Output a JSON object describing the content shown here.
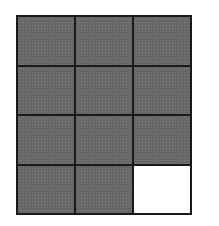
{
  "figure": {
    "rows": 4,
    "columns": 3,
    "shaded_color": "#8a8a8a",
    "empty_color": "#ffffff",
    "line_color": "#1a1a1a",
    "cells": [
      {
        "row": 1,
        "col": 1,
        "state": "shaded"
      },
      {
        "row": 1,
        "col": 2,
        "state": "shaded"
      },
      {
        "row": 1,
        "col": 3,
        "state": "shaded"
      },
      {
        "row": 2,
        "col": 1,
        "state": "shaded"
      },
      {
        "row": 2,
        "col": 2,
        "state": "shaded"
      },
      {
        "row": 2,
        "col": 3,
        "state": "shaded"
      },
      {
        "row": 3,
        "col": 1,
        "state": "shaded"
      },
      {
        "row": 3,
        "col": 2,
        "state": "shaded"
      },
      {
        "row": 3,
        "col": 3,
        "state": "shaded"
      },
      {
        "row": 4,
        "col": 1,
        "state": "shaded"
      },
      {
        "row": 4,
        "col": 2,
        "state": "shaded"
      },
      {
        "row": 4,
        "col": 3,
        "state": "empty"
      }
    ],
    "shaded_count": 11,
    "total_count": 12
  }
}
